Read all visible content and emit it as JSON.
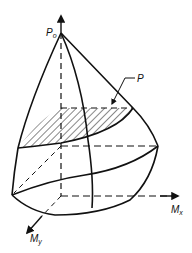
{
  "diagram": {
    "type": "3d-interaction-surface",
    "labels": {
      "apex": "P",
      "apex_sub": "o",
      "plane": "P",
      "x_axis": "M",
      "x_axis_sub": "x",
      "y_axis": "M",
      "y_axis_sub": "y"
    },
    "colors": {
      "stroke": "#111111",
      "background": "#ffffff"
    }
  }
}
